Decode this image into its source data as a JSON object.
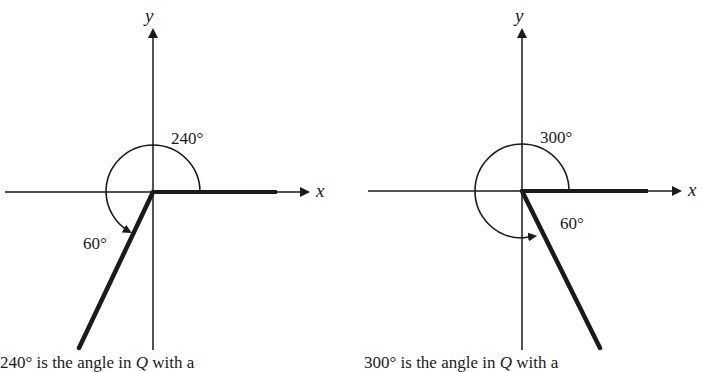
{
  "diagrams": [
    {
      "id": "left",
      "axis_x_label": "x",
      "axis_y_label": "y",
      "angle_label": "240°",
      "reference_angle_label": "60°",
      "angle_degrees": 240,
      "reference_angle_degrees": 60,
      "caption_prefix": "240° is the angle in ",
      "caption_quadrant": "Q",
      "caption_suffix": " with a"
    },
    {
      "id": "right",
      "axis_x_label": "x",
      "axis_y_label": "y",
      "angle_label": "300°",
      "reference_angle_label": "60°",
      "angle_degrees": 300,
      "reference_angle_degrees": 60,
      "caption_prefix": "300° is the angle in ",
      "caption_quadrant": "Q",
      "caption_suffix": " with a"
    }
  ],
  "colors": {
    "ink": "#1a1a1a",
    "background": "#ffffff"
  }
}
